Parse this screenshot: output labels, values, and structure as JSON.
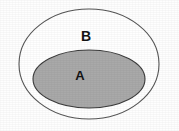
{
  "figure": {
    "kind": "euler-subset-diagram",
    "background_color": "#fefefe",
    "width": 179,
    "height": 131
  },
  "sets": {
    "outer": {
      "label": "B",
      "label_x": 86,
      "label_y": 37,
      "center_x": 89,
      "center_y": 64,
      "radius_x": 70,
      "radius_y": 55,
      "fill_color": "#ffffff",
      "stroke_color": "#565656",
      "stroke_width": 1.1
    },
    "inner": {
      "label": "A",
      "label_x": 80,
      "label_y": 77,
      "center_x": 89,
      "center_y": 79,
      "radius_x": 56,
      "radius_y": 29,
      "fill_color": "#a9a9a9",
      "stroke_color": "#3c3c3c",
      "stroke_width": 1.1
    }
  }
}
